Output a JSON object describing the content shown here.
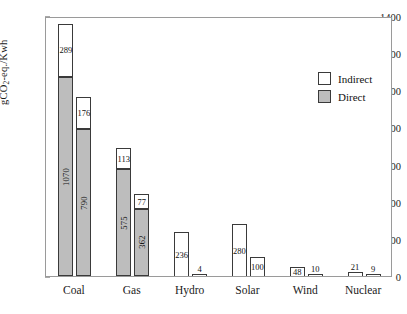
{
  "chart_data": {
    "type": "bar",
    "title": "",
    "subtitle": "",
    "xlabel": "",
    "ylabel": "gCO2-eq./Kwh",
    "ylabel_parts": {
      "pre": "gCO",
      "sub": "2",
      "post": "-eq./Kwh"
    },
    "ylim": [
      0,
      1400
    ],
    "ytick_step": 200,
    "yticks": [
      0,
      200,
      400,
      600,
      800,
      1000,
      1200,
      1400
    ],
    "grid": false,
    "stacked": true,
    "bars_per_category": 2,
    "legend": {
      "position": "top-right",
      "entries": [
        {
          "name": "Indirect",
          "color": "#ffffff",
          "edge": "#3a3a3a"
        },
        {
          "name": "Direct",
          "color": "#bdbdbd",
          "edge": "#3a3a3a"
        }
      ]
    },
    "categories": [
      "Coal",
      "Gas",
      "Hydro",
      "Solar",
      "Wind",
      "Nuclear"
    ],
    "series": [
      {
        "name": "Direct",
        "color": "#bdbdbd",
        "values": [
          [
            1070,
            790
          ],
          [
            575,
            362
          ],
          [
            0,
            0
          ],
          [
            0,
            0
          ],
          [
            0,
            0
          ],
          [
            0,
            0
          ]
        ]
      },
      {
        "name": "Indirect",
        "color": "#ffffff",
        "values": [
          [
            289,
            176
          ],
          [
            113,
            77
          ],
          [
            236,
            4
          ],
          [
            280,
            100
          ],
          [
            48,
            10
          ],
          [
            21,
            9
          ]
        ]
      }
    ],
    "groups": [
      {
        "category": "Coal",
        "bars": [
          {
            "direct": 1070,
            "indirect": 289,
            "total": 1359,
            "direct_label": "1070",
            "indirect_label": "289",
            "indirect_label_inside": true
          },
          {
            "direct": 790,
            "indirect": 176,
            "total": 966,
            "direct_label": "790",
            "indirect_label": "176",
            "indirect_label_inside": true
          }
        ]
      },
      {
        "category": "Gas",
        "bars": [
          {
            "direct": 575,
            "indirect": 113,
            "total": 688,
            "direct_label": "575",
            "indirect_label": "113",
            "indirect_label_inside": true
          },
          {
            "direct": 362,
            "indirect": 77,
            "total": 439,
            "direct_label": "362",
            "indirect_label": "77",
            "indirect_label_inside": true
          }
        ]
      },
      {
        "category": "Hydro",
        "bars": [
          {
            "direct": 0,
            "indirect": 236,
            "total": 236,
            "direct_label": "",
            "indirect_label": "236",
            "indirect_label_inside": true
          },
          {
            "direct": 0,
            "indirect": 4,
            "total": 4,
            "direct_label": "",
            "indirect_label": "4",
            "indirect_label_inside": false
          }
        ]
      },
      {
        "category": "Solar",
        "bars": [
          {
            "direct": 0,
            "indirect": 280,
            "total": 280,
            "direct_label": "",
            "indirect_label": "280",
            "indirect_label_inside": true
          },
          {
            "direct": 0,
            "indirect": 100,
            "total": 100,
            "direct_label": "",
            "indirect_label": "100",
            "indirect_label_inside": true
          }
        ]
      },
      {
        "category": "Wind",
        "bars": [
          {
            "direct": 0,
            "indirect": 48,
            "total": 48,
            "direct_label": "",
            "indirect_label": "48",
            "indirect_label_inside": true
          },
          {
            "direct": 0,
            "indirect": 10,
            "total": 10,
            "direct_label": "",
            "indirect_label": "10",
            "indirect_label_inside": false
          }
        ]
      },
      {
        "category": "Nuclear",
        "bars": [
          {
            "direct": 0,
            "indirect": 21,
            "total": 21,
            "direct_label": "",
            "indirect_label": "21",
            "indirect_label_inside": false
          },
          {
            "direct": 0,
            "indirect": 9,
            "total": 9,
            "direct_label": "",
            "indirect_label": "9",
            "indirect_label_inside": false
          }
        ]
      }
    ]
  }
}
